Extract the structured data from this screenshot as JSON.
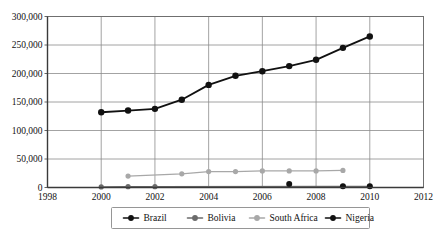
{
  "chart_data": {
    "type": "line",
    "title": "",
    "xlabel": "",
    "ylabel": "",
    "xlim": [
      1998,
      2012
    ],
    "ylim": [
      0,
      300000
    ],
    "grid": true,
    "legend_position": "bottom",
    "x_ticks": [
      "1998",
      "2000",
      "2002",
      "2004",
      "2006",
      "2008",
      "2010",
      "2012"
    ],
    "y_ticks": [
      "0",
      "50,000",
      "100,000",
      "150,000",
      "200,000",
      "250,000",
      "300,000"
    ],
    "y_tick_values": [
      0,
      50000,
      100000,
      150000,
      200000,
      250000,
      300000
    ],
    "x_tick_values": [
      1998,
      2000,
      2002,
      2004,
      2006,
      2008,
      2010,
      2012
    ],
    "series": [
      {
        "name": "Brazil",
        "color": "#111111",
        "marker": "circle",
        "line_width": 1.8,
        "marker_size": 3.2,
        "x": [
          2000,
          2001,
          2002,
          2003,
          2004,
          2005,
          2006,
          2007,
          2008,
          2009,
          2010
        ],
        "values": [
          132000,
          135000,
          138000,
          154000,
          180000,
          196000,
          204000,
          213000,
          224000,
          245000,
          265000
        ]
      },
      {
        "name": "Bolivia",
        "color": "#6b6b6b",
        "marker": "circle",
        "line_width": 1.4,
        "marker_size": 2.6,
        "x": [
          2000,
          2001,
          2002,
          2009,
          2010
        ],
        "values": [
          1000,
          1500,
          1500,
          2000,
          2000
        ]
      },
      {
        "name": "South Africa",
        "color": "#a8a8a8",
        "marker": "circle",
        "line_width": 1.3,
        "marker_size": 2.6,
        "x": [
          2001,
          2003,
          2004,
          2005,
          2006,
          2007,
          2008,
          2009
        ],
        "values": [
          20000,
          24000,
          28000,
          28000,
          29000,
          29000,
          29000,
          30000
        ]
      },
      {
        "name": "Nigeria",
        "color": "#111111",
        "marker": "circle",
        "line_width": 0,
        "marker_size": 3.0,
        "x": [
          2007,
          2009,
          2010
        ],
        "values": [
          6000,
          2000,
          2000
        ]
      }
    ]
  },
  "legend": {
    "entries": [
      {
        "label": "Brazil",
        "color": "#111111"
      },
      {
        "label": "Bolivia",
        "color": "#6b6b6b"
      },
      {
        "label": "South Africa",
        "color": "#a8a8a8"
      },
      {
        "label": "Nigeria",
        "color": "#111111"
      }
    ]
  }
}
